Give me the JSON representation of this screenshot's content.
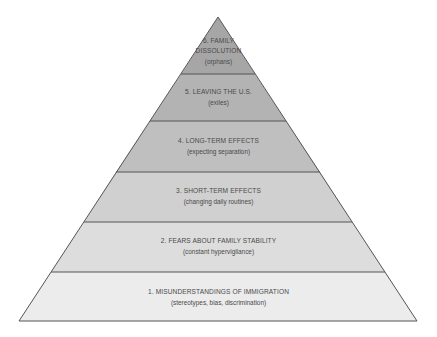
{
  "diagram": {
    "type": "pyramid",
    "levels": [
      {
        "number": "6.",
        "title": "6. FAMILY DISSOLUTION",
        "title_line1": "6. FAMILY",
        "title_line2": "DISSOLUTION",
        "subtitle": "(orphans)",
        "fill": "#a6a6a6"
      },
      {
        "number": "5.",
        "title": "5. LEAVING THE U.S.",
        "subtitle": "(exiles)",
        "fill": "#b3b3b3"
      },
      {
        "number": "4.",
        "title": "4. LONG-TERM EFFECTS",
        "subtitle": "(expecting separation)",
        "fill": "#bfbfbf"
      },
      {
        "number": "3.",
        "title": "3. SHORT-TERM EFFECTS",
        "subtitle": "(changing daily routines)",
        "fill": "#d0d0d0"
      },
      {
        "number": "2.",
        "title": "2. FEARS ABOUT FAMILY STABILITY",
        "subtitle": "(constant hypervigilance)",
        "fill": "#dddddd"
      },
      {
        "number": "1.",
        "title": "1. MISUNDERSTANDINGS OF IMMIGRATION",
        "subtitle": "(stereotypes, bias, discrimination)",
        "fill": "#ececec"
      }
    ],
    "colors": {
      "outline": "#555555",
      "text": "#4a4a4a",
      "background": "#ffffff"
    }
  }
}
